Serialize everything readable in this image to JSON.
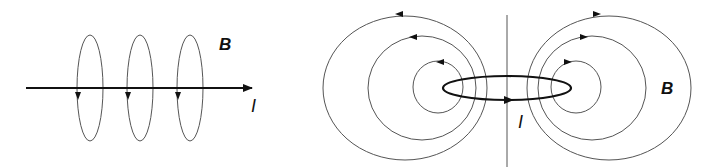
{
  "left_panel": {
    "field_label": "B",
    "current_label": "I",
    "description": "Straight wire carrying current I with circular magnetic field loops B"
  },
  "right_panel": {
    "field_label": "B",
    "current_label": "I",
    "description": "Current loop (ring) with dipole-like magnetic field lines B"
  },
  "colors": {
    "line": "#111111",
    "field": "#555555",
    "background": "#ffffff"
  }
}
